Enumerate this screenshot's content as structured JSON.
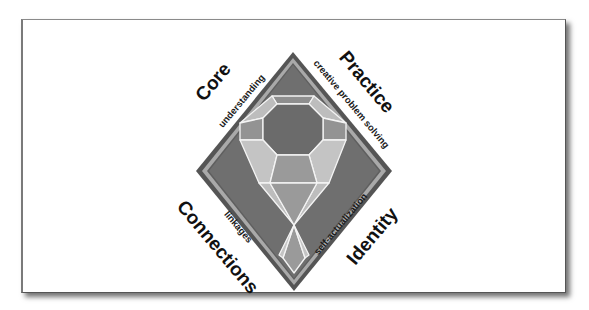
{
  "diagram": {
    "title": "",
    "colors": {
      "background": "#ffffff",
      "diamond_outer": "#5a5a5a",
      "diamond_band": "#a8a8a8",
      "diamond_fill": "#6e6e6e",
      "gem_outline": "#f2f2f2",
      "facet_dark": "#6a6a6a",
      "facet_mid": "#9a9a9a",
      "facet_light": "#c2c2c2",
      "text": "#111111"
    },
    "quadrants": [
      {
        "id": "core",
        "label": "Core",
        "sublabel": "understanding",
        "position": "top-left"
      },
      {
        "id": "practice",
        "label": "Practice",
        "sublabel": "creative problem solving",
        "position": "top-right"
      },
      {
        "id": "connections",
        "label": "Connections",
        "sublabel": "linkages",
        "position": "bottom-left"
      },
      {
        "id": "identity",
        "label": "Identity",
        "sublabel": "self-actualization",
        "position": "bottom-right"
      }
    ]
  }
}
